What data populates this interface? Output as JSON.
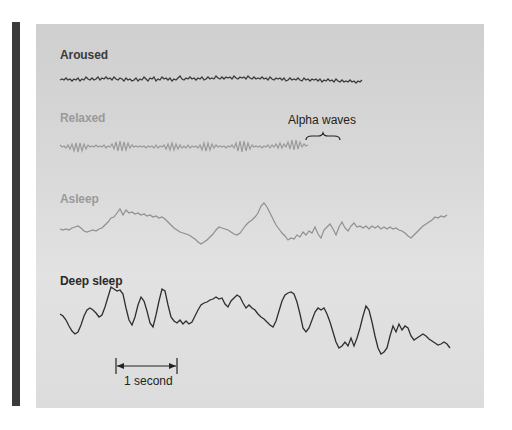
{
  "figure": {
    "traces": [
      {
        "label": "Aroused",
        "color": "#3a3a3a",
        "pattern": "low-amplitude high-frequency"
      },
      {
        "label": "Relaxed",
        "color": "#9a9a9a",
        "pattern": "alpha waves"
      },
      {
        "label": "Asleep",
        "color": "#8f8f8f",
        "pattern": "mixed slower waves"
      },
      {
        "label": "Deep sleep",
        "color": "#2f2f2f",
        "pattern": "high-amplitude slow waves"
      }
    ],
    "annotations": {
      "alpha_waves": "Alpha waves",
      "scale_bar": "1 second"
    }
  }
}
